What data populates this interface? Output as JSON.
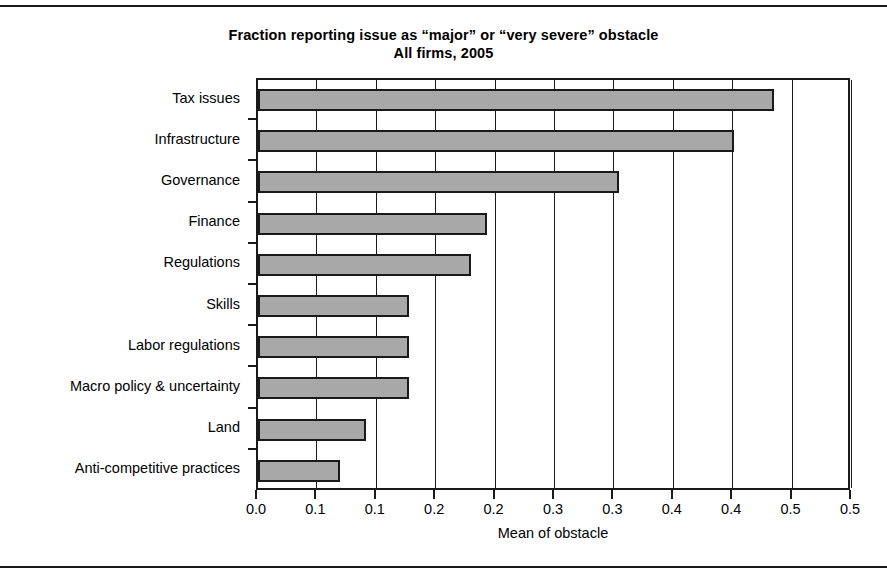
{
  "chart_data": {
    "type": "bar",
    "orientation": "horizontal",
    "title": "Fraction reporting issue as “major” or “very severe” obstacle",
    "subtitle": "All firms, 2005",
    "xlabel": "Mean of obstacle",
    "ylabel": "",
    "xlim": [
      0.0,
      0.5
    ],
    "x_tick_labels": [
      "0.0",
      "0.1",
      "0.1",
      "0.2",
      "0.2",
      "0.3",
      "0.3",
      "0.4",
      "0.4",
      "0.5",
      "0.5"
    ],
    "x_tick_values": [
      0.0,
      0.05,
      0.1,
      0.15,
      0.2,
      0.25,
      0.3,
      0.35,
      0.4,
      0.45,
      0.5
    ],
    "grid": true,
    "grid_axis": "x",
    "legend": "none",
    "categories": [
      "Tax issues",
      "Infrastructure",
      "Governance",
      "Finance",
      "Regulations",
      "Skills",
      "Labor regulations",
      "Macro policy & uncertainty",
      "Land",
      "Anti-competitive practices"
    ],
    "values": [
      0.434,
      0.401,
      0.304,
      0.193,
      0.179,
      0.127,
      0.127,
      0.127,
      0.091,
      0.069
    ],
    "bar_fill": "#a8a8a8",
    "bar_edge": "#1a1a1a"
  },
  "chart": {
    "title_line1": "Fraction reporting issue as “major” or “very severe” obstacle",
    "title_line2": "All firms, 2005",
    "x_axis_title": "Mean of obstacle"
  }
}
